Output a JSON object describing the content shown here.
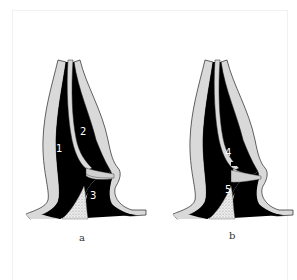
{
  "figure": {
    "panels": [
      {
        "caption": "a",
        "regions": [
          {
            "label": "1"
          },
          {
            "label": "2"
          },
          {
            "label": "3"
          }
        ]
      },
      {
        "caption": "b",
        "regions": [
          {
            "label": "4"
          },
          {
            "label": "5"
          }
        ]
      }
    ],
    "colors": {
      "fill_dark": "#000000",
      "wall": "#d9d9d9",
      "stipple": "#c8c8c8",
      "background": "#ffffff"
    }
  }
}
